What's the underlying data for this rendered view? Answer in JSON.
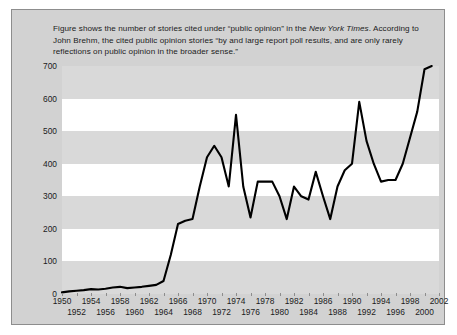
{
  "caption": {
    "line1_pre": "Figure shows the number of stories cited under “public opinion” in the ",
    "line1_italic": "New York Times",
    "line1_post": ".",
    "line2": "According to John Brehm, the cited public opinion stories “by and large report poll results,",
    "line3": "and are only rarely reflections on public opinion in the broader sense.”"
  },
  "chart_data": {
    "type": "line",
    "title": "",
    "xlabel": "",
    "ylabel": "",
    "xlim": [
      1950,
      2002
    ],
    "ylim": [
      0,
      700
    ],
    "grid": false,
    "banded_background": true,
    "legend": null,
    "line_color": "#000000",
    "ytick_labels": [
      "0",
      "100",
      "200",
      "300",
      "400",
      "500",
      "600",
      "700"
    ],
    "ytick_values": [
      0,
      100,
      200,
      300,
      400,
      500,
      600,
      700
    ],
    "xtick_labels_row_top": [
      "1950",
      "1954",
      "1958",
      "1962",
      "1966",
      "1970",
      "1974",
      "1978",
      "1982",
      "1986",
      "1990",
      "1994",
      "1998",
      "2002"
    ],
    "xtick_labels_row_bottom": [
      "1952",
      "1956",
      "1960",
      "1964",
      "1968",
      "1972",
      "1976",
      "1980",
      "1984",
      "1988",
      "1992",
      "1996",
      "2000"
    ],
    "x": [
      1950,
      1951,
      1952,
      1953,
      1954,
      1955,
      1956,
      1957,
      1958,
      1959,
      1960,
      1961,
      1962,
      1963,
      1964,
      1965,
      1966,
      1967,
      1968,
      1969,
      1970,
      1971,
      1972,
      1973,
      1974,
      1975,
      1976,
      1977,
      1978,
      1979,
      1980,
      1981,
      1982,
      1983,
      1984,
      1985,
      1986,
      1987,
      1988,
      1989,
      1990,
      1991,
      1992,
      1993,
      1994,
      1995,
      1996,
      1997,
      1998,
      1999,
      2000,
      2001
    ],
    "values": [
      5,
      8,
      10,
      12,
      15,
      14,
      16,
      20,
      22,
      18,
      20,
      22,
      25,
      28,
      40,
      120,
      215,
      225,
      230,
      330,
      420,
      455,
      420,
      330,
      550,
      330,
      235,
      345,
      345,
      345,
      300,
      230,
      330,
      300,
      290,
      375,
      300,
      230,
      330,
      380,
      400,
      590,
      470,
      400,
      345,
      350,
      350,
      400,
      480,
      560,
      690,
      700
    ]
  }
}
